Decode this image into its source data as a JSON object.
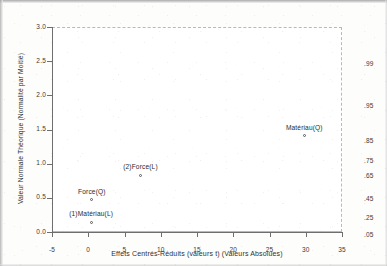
{
  "chart_data": {
    "type": "scatter",
    "title": "",
    "xlabel": "Effets Centrés-Réduits (valeurs t) (Valeurs Absolues)",
    "ylabel": "Valeur Normale Théorique (Normalité par Moitié)",
    "xlim": [
      -5,
      35
    ],
    "ylim": [
      0.0,
      3.0
    ],
    "grid": false,
    "legend": "none",
    "xticks": [
      "-5",
      "0",
      "5",
      "10",
      "15",
      "20",
      "25",
      "30",
      "35"
    ],
    "xtick_values": [
      -5,
      0,
      5,
      10,
      15,
      20,
      25,
      30,
      35
    ],
    "yticks": [
      "0.0",
      "0.5",
      "1.0",
      "1.5",
      "2.0",
      "2.5",
      "3.0"
    ],
    "ytick_values": [
      0.0,
      0.5,
      1.0,
      1.5,
      2.0,
      2.5,
      3.0
    ],
    "right_axis_label": "",
    "right_ticks": [
      ".99",
      ".95",
      ".85",
      ".75",
      ".65",
      ".45",
      ".25",
      ".05"
    ],
    "right_tick_positions": [
      2.57,
      1.96,
      1.44,
      1.15,
      0.93,
      0.6,
      0.32,
      0.06
    ],
    "points": [
      {
        "label": "(1)Matériau(L)",
        "x": 0.4,
        "y": 0.14,
        "label_dx": 0,
        "label_dy": -5
      },
      {
        "label": "Force(Q)",
        "x": 0.5,
        "y": 0.47,
        "label_dx": 0,
        "label_dy": -5
      },
      {
        "label": "(2)Force(L)",
        "x": 7.2,
        "y": 0.83,
        "label_dx": 0,
        "label_dy": -5
      },
      {
        "label": "Matériau(Q)",
        "x": 29.8,
        "y": 1.41,
        "label_dx": 0,
        "label_dy": -5
      }
    ]
  },
  "colors": {
    "axis": "#6e6e6e",
    "frame": "#b9b9b9",
    "text": "#2b2b2b",
    "marker": "#5a5a5a",
    "background": "#ffffff"
  }
}
